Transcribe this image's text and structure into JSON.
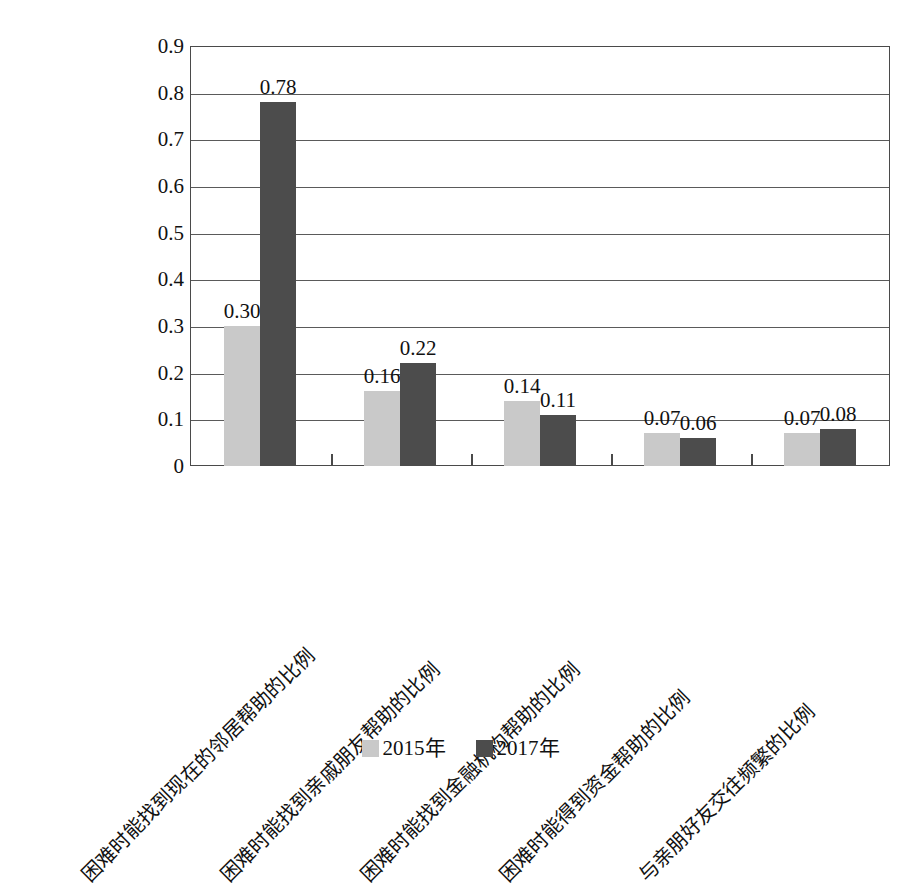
{
  "chart_data": {
    "type": "bar",
    "title": "",
    "xlabel": "",
    "ylabel": "",
    "ylim": [
      0,
      0.9
    ],
    "grid": true,
    "legend_position": "bottom",
    "categories": [
      "困难时能找到现在的邻居帮助的比例",
      "困难时能找到亲戚朋友帮助的比例",
      "困难时能找到金融机构帮助的比例",
      "困难时能得到资金帮助的比例",
      "与亲朋好友交往频繁的比例"
    ],
    "series": [
      {
        "name": "2015年",
        "color": "#c9c9c9",
        "values": [
          0.3,
          0.16,
          0.14,
          0.07,
          0.07
        ],
        "labels": [
          "0.30",
          "0.16",
          "0.14",
          "0.07",
          "0.07"
        ]
      },
      {
        "name": "2017年",
        "color": "#4c4c4c",
        "values": [
          0.78,
          0.22,
          0.11,
          0.06,
          0.08
        ],
        "labels": [
          "0.78",
          "0.22",
          "0.11",
          "0.06",
          "0.08"
        ]
      }
    ],
    "yticks": [
      "0.9",
      "0.8",
      "0.7",
      "0.6",
      "0.5",
      "0.4",
      "0.3",
      "0.2",
      "0.1",
      "0"
    ],
    "ytick_values": [
      0.9,
      0.8,
      0.7,
      0.6,
      0.5,
      0.4,
      0.3,
      0.2,
      0.1,
      0
    ]
  },
  "legend": {
    "items": [
      {
        "label": "2015年",
        "color": "#c9c9c9"
      },
      {
        "label": "2017年",
        "color": "#4c4c4c"
      }
    ]
  },
  "axis": {
    "y_max": 0.9,
    "y_min": 0
  }
}
